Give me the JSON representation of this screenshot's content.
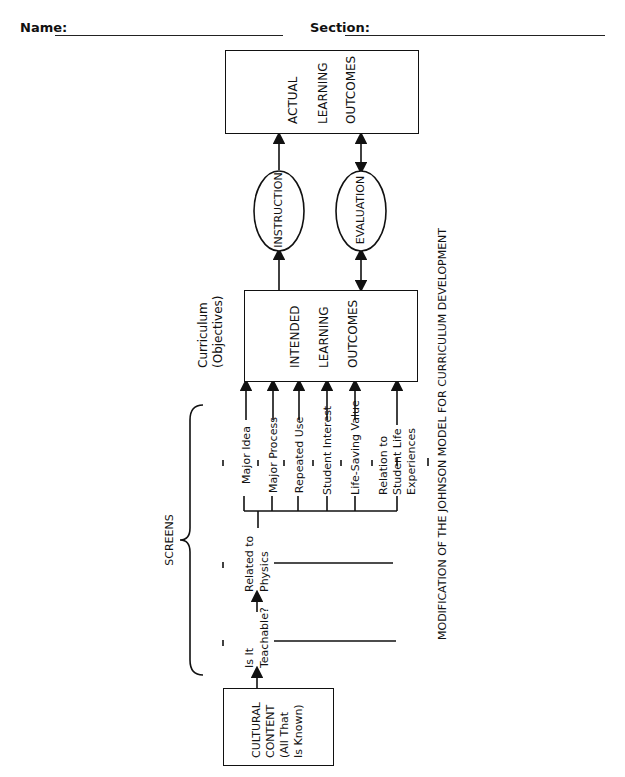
{
  "header": {
    "name_label": "Name:",
    "section_label": "Section:"
  },
  "diagram": {
    "caption": "MODIFICATION OF THE JOHNSON MODEL FOR CURRICULUM DEVELOPMENT",
    "actual_outcomes": {
      "lines": [
        "ACTUAL",
        "LEARNING",
        "OUTCOMES"
      ]
    },
    "instruction": "INSTRUCTION",
    "evaluation": "EVALUATION",
    "curriculum_label": [
      "Curriculum",
      "(Objectives)"
    ],
    "intended_outcomes": {
      "lines": [
        "INTENDED",
        "LEARNING",
        "OUTCOMES"
      ]
    },
    "screens_label": "SCREENS",
    "screen_criteria": [
      {
        "lines": [
          "Major Idea"
        ]
      },
      {
        "lines": [
          "Major Process"
        ]
      },
      {
        "lines": [
          "Repeated Use"
        ]
      },
      {
        "lines": [
          "Student Interest"
        ]
      },
      {
        "lines": [
          "Life-Saving Value"
        ]
      },
      {
        "lines": [
          "Relation to",
          "Student Life",
          "Experiences"
        ]
      }
    ],
    "related_to_physics": [
      "Related to",
      "Physics"
    ],
    "is_it_teachable": [
      "Is It",
      "Teachable?"
    ],
    "cultural_content": [
      "CULTURAL",
      "CONTENT",
      "(All That",
      "Is Known)"
    ]
  }
}
